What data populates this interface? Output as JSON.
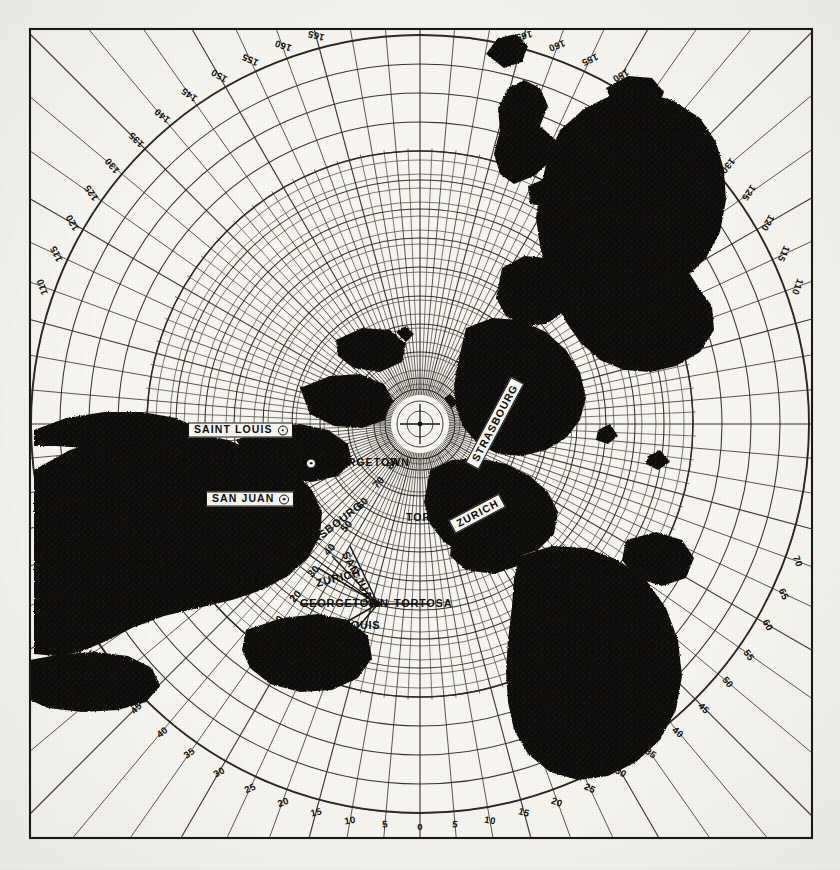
{
  "chart_data": {
    "type": "map",
    "projection": "azimuthal equidistant / great-circle bearing chart",
    "grid": true,
    "frame": {
      "left": 30,
      "top": 29,
      "right": 812,
      "bottom": 838
    },
    "center": {
      "x": 420,
      "y": 424
    },
    "outer_bearing_scale": {
      "unit": "degrees",
      "label_step": 5,
      "min": 0,
      "max": 180,
      "note": "0 at bottom centre, 180 at top centre; values mirror left and right",
      "labels_bottom": [
        "0",
        "5",
        "10",
        "15",
        "20",
        "25",
        "30",
        "35"
      ],
      "labels_left_side": [
        "40",
        "45",
        "50",
        "55",
        "60",
        "65",
        "70",
        "75",
        "80",
        "85",
        "90",
        "95",
        "100",
        "105",
        "110",
        "115",
        "120",
        "125",
        "130",
        "135",
        "140",
        "145",
        "150",
        "155",
        "160",
        "165",
        "170",
        "175",
        "180"
      ],
      "labels_right_side": [
        "40",
        "45",
        "50",
        "55",
        "60",
        "65",
        "70",
        "75",
        "80",
        "85",
        "90",
        "95",
        "100",
        "105",
        "110",
        "115",
        "120",
        "125",
        "130",
        "135",
        "140",
        "145",
        "150",
        "155",
        "160",
        "165",
        "170",
        "175",
        "180"
      ]
    },
    "radial_distance_scale": {
      "unit": "degrees of arc from centre",
      "labels": [
        "80",
        "70",
        "60",
        "50",
        "40",
        "30",
        "20",
        "10",
        "0"
      ],
      "note": "decreasing outward from the polar hub along the bearing meridian"
    },
    "stations": [
      {
        "name": "SAINT LOUIS",
        "x": 188,
        "y": 430,
        "style": "boxed",
        "marker": "right"
      },
      {
        "name": "GEORGETOWN",
        "x": 306,
        "y": 463,
        "style": "plain",
        "marker": "left"
      },
      {
        "name": "SAN JUAN",
        "x": 206,
        "y": 499,
        "style": "boxed",
        "marker": "right"
      },
      {
        "name": "TORTOSA",
        "x": 406,
        "y": 518,
        "style": "plain",
        "marker": "right"
      },
      {
        "name": "STRASBOURG",
        "x": 472,
        "y": 466,
        "style": "boxed",
        "marker": "none",
        "rotation": -62
      },
      {
        "name": "ZURICH",
        "x": 452,
        "y": 527,
        "style": "boxed",
        "marker": "none",
        "rotation": -28
      }
    ],
    "convergence_spokes": [
      {
        "name": "STRASBOURG",
        "x": 294,
        "y": 556,
        "rotation": -38
      },
      {
        "name": "SAN JUAN",
        "x": 345,
        "y": 552,
        "rotation": 62
      },
      {
        "name": "ZURICH",
        "x": 316,
        "y": 583,
        "rotation": -14
      },
      {
        "name": "GEORGETOWN",
        "x": 300,
        "y": 603,
        "rotation": 0
      },
      {
        "name": "TORTOSA",
        "x": 394,
        "y": 603,
        "rotation": 0
      },
      {
        "name": "SAINT LOUIS",
        "x": 303,
        "y": 625,
        "rotation": 0
      }
    ],
    "colors": {
      "land": "#121008",
      "ocean": "#f7f6f1",
      "graticule": "#2b2720",
      "frame": "#1a1813",
      "paper": "#f4f3ee",
      "text": "#0d0c09"
    }
  }
}
